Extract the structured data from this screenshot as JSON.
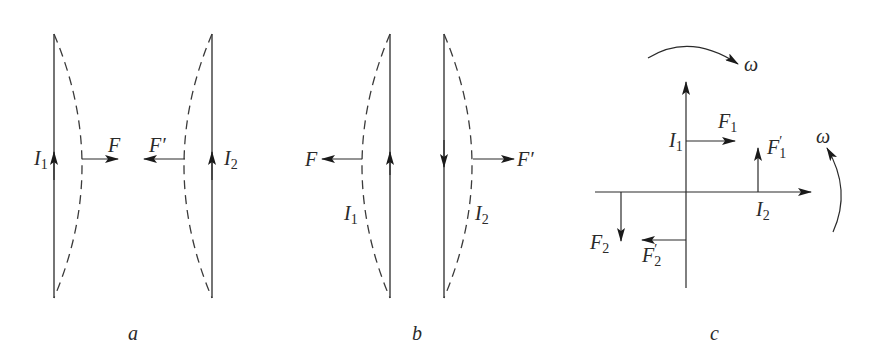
{
  "figure": {
    "panels": [
      {
        "id": "a",
        "caption": "a",
        "labels": {
          "current_left": "I",
          "current_left_sub": "1",
          "current_right": "I",
          "current_right_sub": "2",
          "force_left": "F",
          "force_right": "F′"
        },
        "description": "Two parallel wires with currents in the same direction attract each other"
      },
      {
        "id": "b",
        "caption": "b",
        "labels": {
          "current_left": "I",
          "current_left_sub": "1",
          "current_right": "I",
          "current_right_sub": "2",
          "force_left": "F",
          "force_right": "F′"
        },
        "description": "Two parallel wires with currents in opposite directions repel each other"
      },
      {
        "id": "c",
        "caption": "c",
        "labels": {
          "current_vertical": "I",
          "current_vertical_sub": "1",
          "current_horizontal": "I",
          "current_horizontal_sub": "2",
          "force_1": "F",
          "force_1_sub": "1",
          "force_1p": "F",
          "force_1p_sub": "1",
          "force_2": "F",
          "force_2_sub": "2",
          "force_2p": "F",
          "force_2p_sub": "2",
          "prime": "′",
          "omega_top": "ω",
          "omega_right": "ω"
        },
        "description": "Two perpendicular wires experience torques tending to rotate them into parallel alignment"
      }
    ]
  }
}
